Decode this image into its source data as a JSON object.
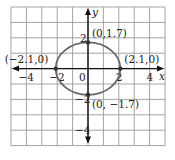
{
  "chart_data": {
    "type": "line",
    "title": "",
    "xlabel": "x",
    "ylabel": "y",
    "xlim": [
      -5,
      5
    ],
    "ylim": [
      -5,
      4
    ],
    "grid": true,
    "grid_step": 1,
    "x_ticks": [
      {
        "value": -4,
        "label": "−4"
      },
      {
        "value": -2,
        "label": "−2"
      },
      {
        "value": 0,
        "label": "0"
      },
      {
        "value": 2,
        "label": "2"
      },
      {
        "value": 4,
        "label": "4"
      }
    ],
    "y_ticks": [
      {
        "value": 2,
        "label": "2"
      },
      {
        "value": -2,
        "label": "−2"
      },
      {
        "value": -4,
        "label": "−4"
      }
    ],
    "curve": {
      "shape": "ellipse",
      "center": [
        0,
        0
      ],
      "semi_axis_x": 2.1,
      "semi_axis_y": 1.7,
      "color": "#666666"
    },
    "points": [
      {
        "x": 0,
        "y": 1.7,
        "label": "(0,1.7)"
      },
      {
        "x": 2.1,
        "y": 0,
        "label": "(2.1,0)"
      },
      {
        "x": -2.1,
        "y": 0,
        "label": "(−2.1,0)"
      },
      {
        "x": 0,
        "y": -1.7,
        "label": "(0, −1.7)"
      }
    ],
    "colors": {
      "grid": "#9a9a9a",
      "axis": "#111111",
      "curve": "#666666",
      "point": "#333333"
    }
  }
}
